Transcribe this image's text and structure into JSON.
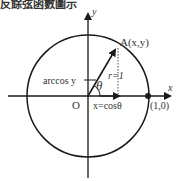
{
  "title": "反餘弦函數圖示",
  "diagram": {
    "axis_x_label": "x",
    "axis_y_label": "y",
    "origin_label": "O",
    "point_A_label": "A(x,y)",
    "radius_label": "r=1",
    "angle_label": "θ",
    "arccos_label": "arccos y",
    "x_eq_label": "x=cosθ",
    "unit_point_label": "(1,0)",
    "colors": {
      "stroke": "#1a1a1a",
      "text": "#333333"
    }
  }
}
